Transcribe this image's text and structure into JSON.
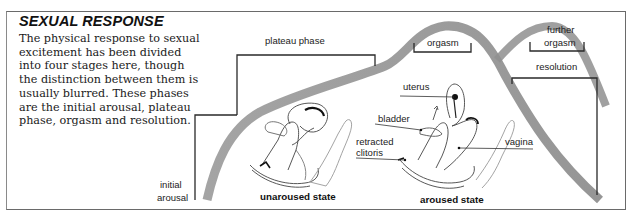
{
  "panel": {
    "title": "SEXUAL RESPONSE",
    "description_lines": [
      "The physical response to sexual",
      "excitement has been divided",
      "into four stages here, though",
      "the distinction between them is",
      "usually blurred. These phases",
      "are the initial arousal, plateau",
      "phase, orgasm and resolution."
    ]
  },
  "response_curve": {
    "color": "#8c8c8c",
    "phases": {
      "initial_arousal": [
        "initial",
        "arousal"
      ],
      "plateau": "plateau phase",
      "orgasm": "orgasm",
      "further_orgasm": [
        "further",
        "orgasm"
      ],
      "resolution": "resolution"
    }
  },
  "illustrations": {
    "unaroused": {
      "caption": "unaroused state"
    },
    "aroused": {
      "caption": "aroused state",
      "labels": {
        "uterus": "uterus",
        "bladder": "bladder",
        "clitoris": [
          "retracted",
          "clitoris"
        ],
        "vagina": "vagina"
      }
    }
  }
}
